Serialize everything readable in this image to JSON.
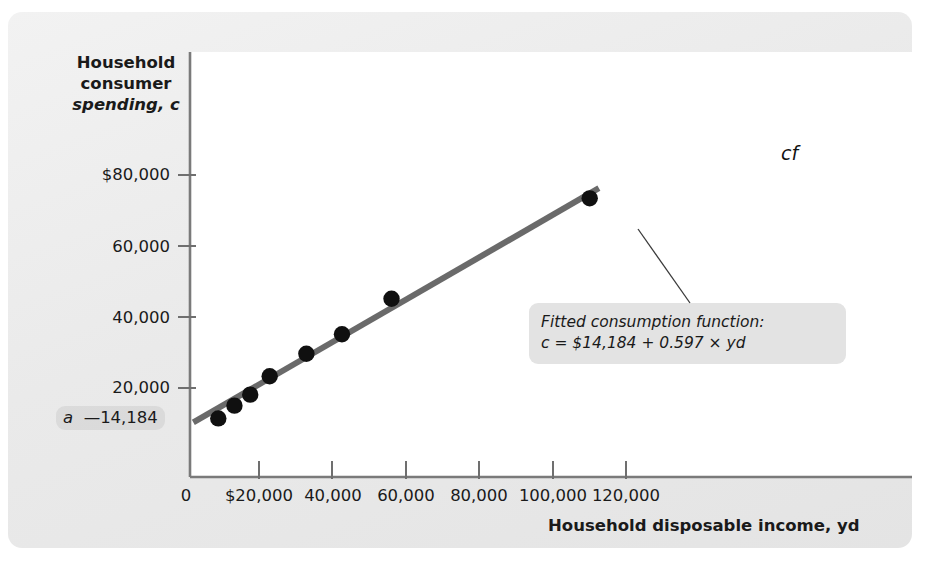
{
  "figure": {
    "y_axis_title_lines": [
      "Household",
      "consumer",
      "spending, c"
    ],
    "x_axis_title": "Household disposable income, yd",
    "intercept_label": "a",
    "intercept_value": "—14,184",
    "series_label": "cf",
    "callout_line1": "Fitted consumption function:",
    "callout_line2": "c = $14,184 + 0.597 × yd",
    "line_color": "#6a6a6a",
    "point_color": "#101010",
    "panel_color": "#ececec",
    "plot_background": "#ffffff"
  },
  "chart_data": {
    "type": "scatter",
    "title": "",
    "xlabel": "Household disposable income, yd",
    "ylabel": "Household consumer spending, c",
    "xlim": [
      0,
      126000
    ],
    "ylim": [
      0,
      88000
    ],
    "grid": false,
    "legend": "none",
    "x_ticks": [
      0,
      20000,
      40000,
      60000,
      80000,
      100000,
      120000
    ],
    "x_tick_labels": [
      "0",
      "$20,000",
      "40,000",
      "60,000",
      "80,000",
      "100,000",
      "120,000"
    ],
    "y_ticks": [
      20000,
      40000,
      60000,
      80000
    ],
    "y_tick_labels": [
      "20,000",
      "40,000",
      "60,000",
      "$80,000"
    ],
    "points": [
      {
        "x": 8800,
        "y": 16500
      },
      {
        "x": 13200,
        "y": 20100
      },
      {
        "x": 17500,
        "y": 23200
      },
      {
        "x": 22800,
        "y": 28400
      },
      {
        "x": 32800,
        "y": 34700
      },
      {
        "x": 42500,
        "y": 40200
      },
      {
        "x": 56000,
        "y": 50200
      },
      {
        "x": 110000,
        "y": 78500
      }
    ],
    "fit_line": {
      "name": "cf",
      "intercept": 14184,
      "slope": 0.597,
      "equation": "c = $14,184 + 0.597 × yd",
      "x_start": 2000,
      "x_end": 112500
    },
    "annotations": [
      {
        "text": "Fitted consumption function:",
        "type": "callout"
      },
      {
        "text": "c = $14,184 + 0.597 × yd",
        "type": "callout"
      },
      {
        "text": "cf",
        "type": "series-label"
      },
      {
        "text": "a",
        "type": "intercept-marker"
      },
      {
        "text": "—14,184",
        "type": "intercept-value"
      }
    ]
  }
}
